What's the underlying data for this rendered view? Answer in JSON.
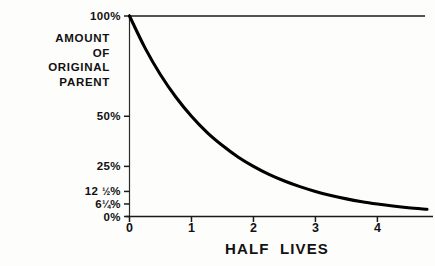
{
  "chart_data": {
    "type": "line",
    "title": "",
    "subtitle": "",
    "xlabel": "HALF  LIVES",
    "ylabel": "AMOUNT OF ORIGINAL PARENT",
    "ylabel_lines": [
      "AMOUNT",
      "OF",
      "ORIGINAL",
      "PARENT"
    ],
    "xlim": [
      0,
      4.8
    ],
    "ylim": [
      0,
      100
    ],
    "grid": false,
    "legend": null,
    "legend_position": "none",
    "x_ticks": [
      {
        "value": 0,
        "label": "0"
      },
      {
        "value": 1,
        "label": "1"
      },
      {
        "value": 2,
        "label": "2"
      },
      {
        "value": 3,
        "label": "3"
      },
      {
        "value": 4,
        "label": "4"
      }
    ],
    "y_ticks": [
      {
        "value": 100,
        "label": "100%",
        "whole": "100",
        "fraction": "",
        "percent": "%"
      },
      {
        "value": 50,
        "label": "50%",
        "whole": "50",
        "fraction": "",
        "percent": "%"
      },
      {
        "value": 25,
        "label": "25%",
        "whole": "25",
        "fraction": "",
        "percent": "%"
      },
      {
        "value": 12.5,
        "label": "12 1/2%",
        "whole": "12 ",
        "fraction": "½",
        "percent": "%"
      },
      {
        "value": 6.25,
        "label": "6 1/4%",
        "whole": "6",
        "fraction": "¼",
        "percent": "%"
      },
      {
        "value": 0,
        "label": "0%",
        "whole": "0",
        "fraction": "",
        "percent": "%"
      }
    ],
    "series": [
      {
        "name": "Parent remaining",
        "formula": "y = 100 * (1/2)^x",
        "x": [
          0,
          0.25,
          0.5,
          0.75,
          1,
          1.25,
          1.5,
          1.75,
          2,
          2.25,
          2.5,
          2.75,
          3,
          3.25,
          3.5,
          3.75,
          4,
          4.25,
          4.5,
          4.8
        ],
        "values": [
          100,
          84.1,
          70.7,
          59.5,
          50,
          42.0,
          35.4,
          29.7,
          25,
          21.0,
          17.7,
          14.9,
          12.5,
          10.5,
          8.8,
          7.4,
          6.25,
          5.25,
          4.4,
          3.6
        ]
      }
    ],
    "colors": {
      "curve": "#000000",
      "axis": "#1a1a1a",
      "text": "#111111",
      "background": "#fdfdfc"
    }
  }
}
